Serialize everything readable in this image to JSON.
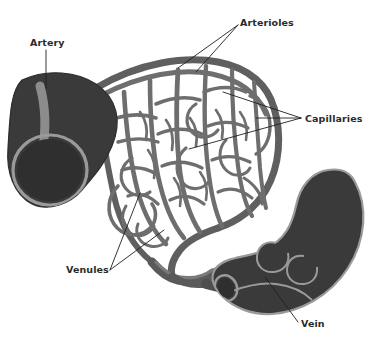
{
  "figure": {
    "background_color": "#ffffff",
    "width": 373,
    "height": 345
  },
  "palette": {
    "vessel_dark": "#3a3a3a",
    "vessel_dark_edge": "#2e2e2e",
    "vessel_highlight": "#8c8c8c",
    "vessel_rim": "#9a9a9a",
    "capillary_gray": "#6e6e6e",
    "capillary_gray_light": "#7b7b7b",
    "lumen_dark": "#303030",
    "label_color": "#2b2b2b",
    "leader_color": "#1f1f1f"
  },
  "labels": [
    {
      "id": "artery",
      "text": "Artery",
      "x": 30,
      "y": 46,
      "anchor": "start",
      "leaders": 1
    },
    {
      "id": "arterioles",
      "text": "Arterioles",
      "x": 240,
      "y": 26,
      "anchor": "start",
      "leaders": 2
    },
    {
      "id": "capillaries",
      "text": "Capillaries",
      "x": 305,
      "y": 122,
      "anchor": "start",
      "leaders": 3
    },
    {
      "id": "venules",
      "text": "Venules",
      "x": 66,
      "y": 273,
      "anchor": "start",
      "leaders": 2
    },
    {
      "id": "vein",
      "text": "Vein",
      "x": 301,
      "y": 327,
      "anchor": "start",
      "leaders": 1
    }
  ],
  "structures": [
    {
      "id": "artery-vessel",
      "name": "Artery",
      "description": "Thick dark tube with highlight stripe and open lumen ring"
    },
    {
      "id": "arteriole-branches",
      "name": "Arterioles",
      "description": "Upper branching vessels feeding capillary bed"
    },
    {
      "id": "capillary-bed",
      "name": "Capillaries",
      "description": "Dense mesh network of fine vessels"
    },
    {
      "id": "venule-branches",
      "name": "Venules",
      "description": "Lower converging vessels draining capillary bed"
    },
    {
      "id": "vein-vessel",
      "name": "Vein",
      "description": "Curved dark tube with valve bulges and lumen ring"
    }
  ]
}
